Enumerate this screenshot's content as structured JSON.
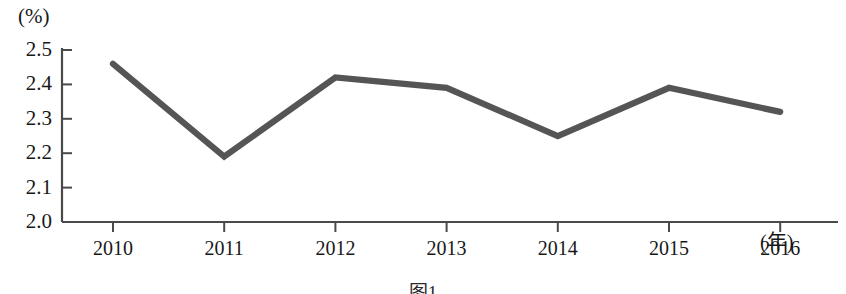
{
  "chart_data": {
    "type": "line",
    "title": "",
    "subtitle": "",
    "xlabel": "年",
    "ylabel": "%",
    "unit_label": "(%)",
    "x_axis_unit_label": "(年)",
    "categories": [
      "2010",
      "2011",
      "2012",
      "2013",
      "2014",
      "2015",
      "2016"
    ],
    "x": [
      2010,
      2011,
      2012,
      2013,
      2014,
      2015,
      2016
    ],
    "values": [
      2.46,
      2.19,
      2.42,
      2.39,
      2.25,
      2.39,
      2.32
    ],
    "series": [
      {
        "name": "",
        "values": [
          2.46,
          2.19,
          2.42,
          2.39,
          2.25,
          2.39,
          2.32
        ]
      }
    ],
    "ylim": [
      2.0,
      2.5
    ],
    "ytick_values": [
      2.5,
      2.4,
      2.3,
      2.2,
      2.1,
      2.0
    ],
    "ytick_labels": [
      "2.5",
      "2.4",
      "2.3",
      "2.2",
      "2.1",
      "2.0"
    ],
    "xtick_labels": [
      "2010",
      "2011",
      "2012",
      "2013",
      "2014",
      "2015",
      "2016"
    ],
    "grid": false,
    "legend": null,
    "legend_position": "none",
    "markers": false,
    "line_color": "#555555",
    "axis_color": "#4a4a4a",
    "background_color": "#ffffff"
  },
  "caption": {
    "text": "图1"
  }
}
